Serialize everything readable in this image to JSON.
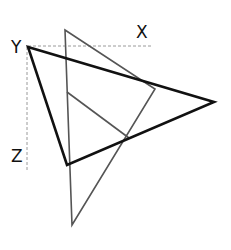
{
  "diagram": {
    "labels": {
      "x": "X",
      "y": "Y",
      "z": "Z"
    },
    "colors": {
      "background": "#ffffff",
      "primary_triangle": "#111111",
      "secondary_triangle": "#555555",
      "axis_dashes": "#9a9a9a",
      "label": "#111111"
    },
    "axes": {
      "horizontal": {
        "x1": 28,
        "y1": 46,
        "x2": 152,
        "y2": 46,
        "style": "dashed"
      },
      "vertical": {
        "x1": 27,
        "y1": 47,
        "x2": 27,
        "y2": 170,
        "style": "dashed"
      }
    },
    "primary_triangle": {
      "points": [
        [
          28,
          47
        ],
        [
          214,
          102
        ],
        [
          67,
          165
        ]
      ],
      "stroke_width": 2.6
    },
    "secondary_triangle": {
      "points": [
        [
          65,
          30
        ],
        [
          155,
          89
        ],
        [
          72,
          225
        ]
      ],
      "stroke_width": 1.6
    },
    "inner_line": {
      "x1": 67,
      "y1": 92,
      "x2": 129,
      "y2": 138
    }
  }
}
